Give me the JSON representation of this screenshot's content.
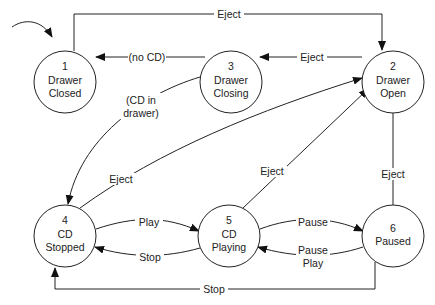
{
  "diagram": {
    "states": [
      {
        "id": "1",
        "number": "1",
        "lines": [
          "Drawer",
          "Closed"
        ],
        "initial": true
      },
      {
        "id": "2",
        "number": "2",
        "lines": [
          "Drawer",
          "Open"
        ]
      },
      {
        "id": "3",
        "number": "3",
        "lines": [
          "Drawer",
          "Closing"
        ]
      },
      {
        "id": "4",
        "number": "4",
        "lines": [
          "CD",
          "Stopped"
        ]
      },
      {
        "id": "5",
        "number": "5",
        "lines": [
          "CD",
          "Playing"
        ]
      },
      {
        "id": "6",
        "number": "6",
        "lines": [
          "Paused"
        ]
      }
    ],
    "transitions": [
      {
        "from": "1",
        "to": "2",
        "label": [
          "Eject"
        ]
      },
      {
        "from": "2",
        "to": "3",
        "label": [
          "Eject"
        ]
      },
      {
        "from": "3",
        "to": "1",
        "label": [
          "(no CD)"
        ]
      },
      {
        "from": "3",
        "to": "4",
        "label": [
          "(CD in",
          "drawer)"
        ]
      },
      {
        "from": "4",
        "to": "2",
        "label": [
          "Eject"
        ]
      },
      {
        "from": "5",
        "to": "2",
        "label": [
          "Eject"
        ]
      },
      {
        "from": "6",
        "to": "2",
        "label": [
          "Eject"
        ]
      },
      {
        "from": "4",
        "to": "5",
        "label": [
          "Play"
        ]
      },
      {
        "from": "5",
        "to": "4",
        "label": [
          "Stop"
        ]
      },
      {
        "from": "5",
        "to": "6",
        "label": [
          "Pause"
        ]
      },
      {
        "from": "6",
        "to": "5",
        "label": [
          "Pause",
          "Play"
        ]
      },
      {
        "from": "6",
        "to": "4",
        "label": [
          "Stop"
        ]
      }
    ]
  }
}
